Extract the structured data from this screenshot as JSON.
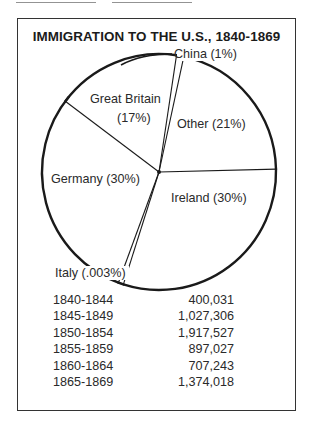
{
  "chart_data": {
    "type": "pie",
    "title": "IMMIGRATION TO THE U.S., 1840-1869",
    "start_angle_deg": 216.8,
    "direction": "clockwise",
    "slices": [
      {
        "name": "Great Britain",
        "label_line1": "Great Britain",
        "label_line2": "(17%)",
        "percent_label": "17%",
        "value": 17
      },
      {
        "name": "China",
        "label_line1": "China (1%)",
        "label_line2": "",
        "percent_label": "1%",
        "value": 1
      },
      {
        "name": "Other",
        "label_line1": "Other (21%)",
        "label_line2": "",
        "percent_label": "21%",
        "value": 21
      },
      {
        "name": "Ireland",
        "label_line1": "Ireland (30%)",
        "label_line2": "",
        "percent_label": "30%",
        "value": 30
      },
      {
        "name": "Italy",
        "label_line1": "Italy (.003%)",
        "label_line2": "",
        "percent_label": ".003%",
        "value": 0.003
      },
      {
        "name": "Germany",
        "label_line1": "Germany (30%)",
        "label_line2": "",
        "percent_label": "30%",
        "value": 30
      }
    ],
    "table": {
      "columns": [
        "Period",
        "Immigrants"
      ],
      "rows": [
        {
          "period": "1840-1844",
          "count": "400,031"
        },
        {
          "period": "1845-1849",
          "count": "1,027,306"
        },
        {
          "period": "1850-1854",
          "count": "1,917,527"
        },
        {
          "period": "1855-1859",
          "count": "897,027"
        },
        {
          "period": "1860-1864",
          "count": "707,243"
        },
        {
          "period": "1865-1869",
          "count": "1,374,018"
        }
      ]
    }
  },
  "colors": {
    "ink": "#1a1a1a",
    "paper": "#ffffff"
  }
}
